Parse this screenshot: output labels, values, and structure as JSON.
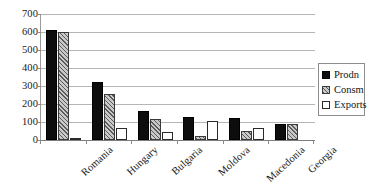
{
  "chart_data": {
    "type": "bar",
    "title": "",
    "subtitle": "",
    "xlabel": "",
    "ylabel": "",
    "categories": [
      "Romania",
      "Hungary",
      "Bulgaria",
      "Moldova",
      "Macedonia",
      "Georgia"
    ],
    "series": [
      {
        "name": "Prodn",
        "values": [
          610,
          320,
          160,
          130,
          120,
          90
        ]
      },
      {
        "name": "Consm",
        "values": [
          600,
          255,
          115,
          25,
          50,
          90
        ]
      },
      {
        "name": "Exports",
        "values": [
          10,
          65,
          45,
          105,
          65,
          5
        ]
      }
    ],
    "ylim": [
      0,
      700
    ],
    "ytick_step": 100,
    "yticks": [
      "700",
      "600",
      "500",
      "400",
      "300",
      "200",
      "100",
      "0"
    ],
    "ytick_values": [
      700,
      600,
      500,
      400,
      300,
      200,
      100,
      0
    ],
    "grid": true,
    "grid_axis": "y",
    "legend_position": "right",
    "legend_entries": [
      "Prodn",
      "Consm",
      "Exports"
    ],
    "annotations": [],
    "colors": {
      "prodn": "#0d0d0d",
      "consm": "#c9c9c9",
      "exports": "#ffffff",
      "gridline": "#b5b5b5",
      "axis": "#8a8a8a",
      "text": "#1a1a1a",
      "background": "#ffffff"
    }
  }
}
